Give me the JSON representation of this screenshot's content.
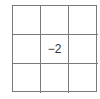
{
  "grid": {
    "rows": 3,
    "cols": 3,
    "cells": [
      [
        "",
        "",
        ""
      ],
      [
        "",
        "−2",
        ""
      ],
      [
        "",
        "",
        ""
      ]
    ]
  }
}
